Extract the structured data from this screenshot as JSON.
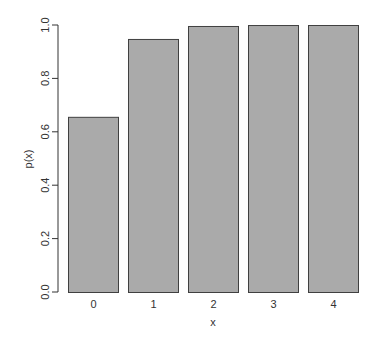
{
  "chart_data": {
    "type": "bar",
    "title": "",
    "xlabel": "x",
    "ylabel": "p(x)",
    "categories": [
      "0",
      "1",
      "2",
      "3",
      "4"
    ],
    "values": [
      0.6561,
      0.9477,
      0.9963,
      0.9999,
      1.0
    ],
    "ylim": [
      0,
      1.0
    ],
    "yticks": [
      0.0,
      0.2,
      0.4,
      0.6,
      0.8,
      1.0
    ],
    "ytick_labels": [
      "0.0",
      "0.2",
      "0.4",
      "0.6",
      "0.8",
      "1.0"
    ],
    "grid": false,
    "legend": null,
    "colors": {
      "bar_fill": "#aaaaaa",
      "bar_border": "#404040",
      "axis": "#333333",
      "background": "#ffffff"
    }
  }
}
